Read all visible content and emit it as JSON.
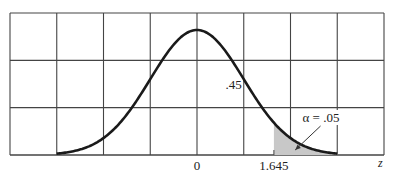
{
  "chart_data": {
    "type": "area",
    "title": "",
    "xlabel": "z",
    "ylabel": "",
    "xlim": [
      -4,
      4
    ],
    "grid": true,
    "grid_columns": 8,
    "grid_rows": 3,
    "distribution": {
      "name": "standard normal",
      "mean": 0,
      "sd": 1,
      "x_range": [
        -3,
        3
      ]
    },
    "tick_labels": [
      {
        "x": 0,
        "label": "0"
      },
      {
        "x": 1.645,
        "label": "1.645"
      }
    ],
    "shaded_region": {
      "from": 1.645,
      "to": 3,
      "area": 0.05
    },
    "annotations": [
      {
        "text": ".45",
        "x": 0.8,
        "meaning": "area between 0 and 1.645"
      },
      {
        "text": "α = .05",
        "x": 2.6,
        "meaning": "upper tail area",
        "arrow_to": 2.1
      }
    ],
    "colors": {
      "curve": "#1a1a1a",
      "grid": "#444444",
      "shade": "#c8c8c8"
    }
  }
}
